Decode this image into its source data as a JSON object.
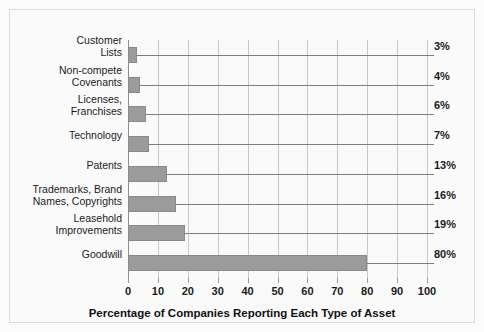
{
  "chart_data": {
    "type": "bar",
    "orientation": "horizontal",
    "title": "",
    "xlabel": "Percentage of Companies Reporting Each Type of Asset",
    "ylabel": "",
    "xlim": [
      0,
      100
    ],
    "xticks": [
      0,
      10,
      20,
      30,
      40,
      50,
      60,
      70,
      80,
      90,
      100
    ],
    "grid": "vertical",
    "legend": "none",
    "categories": [
      "Customer Lists",
      "Non-compete Covenants",
      "Licenses, Franchises",
      "Technology",
      "Patents",
      "Trademarks, Brand Names, Copyrights",
      "Leasehold Improvements",
      "Goodwill"
    ],
    "values": [
      3,
      4,
      6,
      7,
      13,
      16,
      19,
      80
    ],
    "value_labels": [
      "3%",
      "4%",
      "6%",
      "7%",
      "13%",
      "16%",
      "19%",
      "80%"
    ],
    "category_lines": [
      [
        "Customer",
        "Lists"
      ],
      [
        "Non-compete",
        "Covenants"
      ],
      [
        "Licenses,",
        "Franchises"
      ],
      [
        "Technology"
      ],
      [
        "Patents"
      ],
      [
        "Trademarks, Brand",
        "Names, Copyrights"
      ],
      [
        "Leasehold",
        "Improvements"
      ],
      [
        "Goodwill"
      ]
    ],
    "colors": {
      "bar_fill": "#9b9b9b",
      "bar_edge": "#8a8a8a",
      "gridline": "#c8c8c8",
      "axis": "#8e8e8e",
      "leader": "#7d7d7d",
      "text": "#1a1a1a",
      "background": "#fafafa"
    }
  }
}
